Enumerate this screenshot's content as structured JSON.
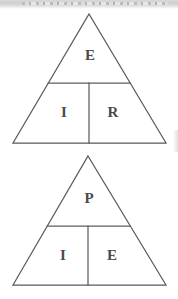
{
  "page": {
    "width": 178,
    "height": 299,
    "background_color": "#ffffff",
    "line_color": "#58585a",
    "text_color": "#4a4a4a"
  },
  "artifacts": {
    "top_strip_label": "scan-artifact-strip",
    "right_edge_label": "scan-artifact-edge"
  },
  "figures": [
    {
      "id": "triangle-1",
      "name": "formula-triangle-eir",
      "apex": {
        "x": 89,
        "y": 14
      },
      "base_left": {
        "x": 13,
        "y": 143
      },
      "base_right": {
        "x": 166,
        "y": 143
      },
      "horizontal_divider_y": 83,
      "vertical_divider_x": 89,
      "cells": {
        "top": "E",
        "bottom_left": "I",
        "bottom_right": "R"
      },
      "label_positions": {
        "top": {
          "x": 90,
          "y": 57
        },
        "bottom_left": {
          "x": 64,
          "y": 114
        },
        "bottom_right": {
          "x": 113,
          "y": 114
        }
      }
    },
    {
      "id": "triangle-2",
      "name": "formula-triangle-pie",
      "apex": {
        "x": 88,
        "y": 156
      },
      "base_left": {
        "x": 13,
        "y": 285
      },
      "base_right": {
        "x": 166,
        "y": 285
      },
      "horizontal_divider_y": 226,
      "vertical_divider_x": 88,
      "cells": {
        "top": "P",
        "bottom_left": "I",
        "bottom_right": "E"
      },
      "label_positions": {
        "top": {
          "x": 89,
          "y": 200
        },
        "bottom_left": {
          "x": 63,
          "y": 257
        },
        "bottom_right": {
          "x": 112,
          "y": 257
        }
      }
    }
  ]
}
